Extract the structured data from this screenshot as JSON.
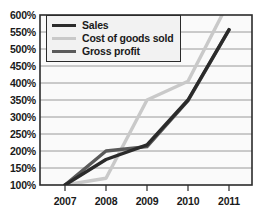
{
  "chart_data": {
    "type": "line",
    "title": "",
    "xlabel": "",
    "ylabel": "",
    "x": [
      "2007",
      "2008",
      "2009",
      "2010",
      "2011"
    ],
    "categories": [
      "2007",
      "2008",
      "2009",
      "2010",
      "2011"
    ],
    "ylim": [
      100,
      600
    ],
    "y_ticks": [
      "100%",
      "150%",
      "200%",
      "250%",
      "300%",
      "350%",
      "400%",
      "450%",
      "500%",
      "550%",
      "600%"
    ],
    "y_tick_values": [
      100,
      150,
      200,
      250,
      300,
      350,
      400,
      450,
      500,
      550,
      600
    ],
    "y_tick_step": 50,
    "y_unit": "%",
    "grid": true,
    "grid_axis": "y",
    "legend_position": "top-left",
    "series": [
      {
        "name": "Sales",
        "color": "#2b2b2b",
        "values": [
          100,
          175,
          218,
          350,
          557
        ]
      },
      {
        "name": "Cost of goods sold",
        "color": "#c9c9c9",
        "values": [
          100,
          120,
          350,
          405,
          640
        ]
      },
      {
        "name": "Gross profit",
        "color": "#5a5a5a",
        "values": [
          100,
          200,
          213,
          348,
          556
        ]
      }
    ]
  },
  "legend": {
    "items": [
      {
        "label": "Sales"
      },
      {
        "label": "Cost of goods sold"
      },
      {
        "label": "Gross profit"
      }
    ]
  },
  "axes": {
    "y": {
      "ticks": [
        "600%",
        "550%",
        "500%",
        "450%",
        "400%",
        "350%",
        "300%",
        "250%",
        "200%",
        "150%",
        "100%"
      ]
    },
    "x": {
      "ticks": [
        "2007",
        "2008",
        "2009",
        "2010",
        "2011"
      ]
    }
  },
  "colors": {
    "sales": "#2b2b2b",
    "cost_of_goods_sold": "#c9c9c9",
    "gross_profit": "#5a5a5a",
    "grid": "#8e8e8e",
    "frame": "#2b2b2b",
    "plot_background": "#fafafa",
    "page_background": "#ffffff",
    "text": "#1a1a1a"
  }
}
